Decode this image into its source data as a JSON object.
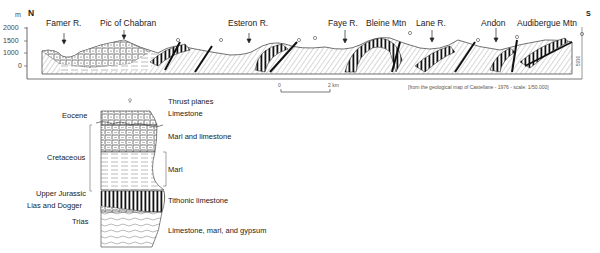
{
  "cross_section": {
    "north_label": "N",
    "south_label": "S",
    "unit_label": "m",
    "y_ticks": [
      "2000",
      "1500",
      "1000",
      "0"
    ],
    "locations": [
      {
        "name": "Famer R.",
        "x": 64
      },
      {
        "name": "Pic of Chabran",
        "x": 124
      },
      {
        "name": "Esteron R.",
        "x": 250
      },
      {
        "name": "Faye R.",
        "x": 345
      },
      {
        "name": "Bleine Mtn",
        "x": 385
      },
      {
        "name": "Lane R.",
        "x": 432
      },
      {
        "name": "Andon",
        "x": 496
      },
      {
        "name": "Audibergue Mtn",
        "x": 555
      }
    ],
    "scale_bar": {
      "start": "0",
      "end": "2 km"
    },
    "source": "[from the geological map of Castellane - 1976 - scale: 1/50.000]",
    "figure_code": "5936"
  },
  "legend": {
    "thrust_label": "Thrust planes",
    "ages": [
      {
        "label": "Eocene"
      },
      {
        "label": "Cretaceous"
      },
      {
        "label": "Upper Jurassic"
      },
      {
        "label": "Lias and Dogger"
      },
      {
        "label": "Trias"
      }
    ],
    "lithologies": [
      {
        "label": "Limestone"
      },
      {
        "label": "Marl and limestone"
      },
      {
        "label": "Marl"
      },
      {
        "label": "Tithonic limestone"
      },
      {
        "label": "Limestone, marl, and gypsum"
      }
    ]
  }
}
